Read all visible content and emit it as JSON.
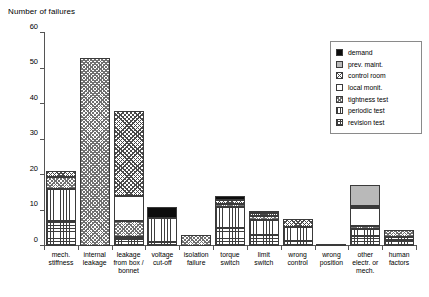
{
  "chart_data": {
    "type": "bar",
    "subtype": "stacked-bar",
    "title": "",
    "ylabel": "Number of failures",
    "xlabel": "",
    "ylim": [
      0,
      60
    ],
    "yticks": [
      0,
      10,
      20,
      30,
      40,
      50,
      60
    ],
    "grid": false,
    "legend_position": "right-top",
    "categories": [
      "mech.\nstiffness",
      "internal\nleakage",
      "leakage\nfrom box /\nbonnet",
      "voltage\ncut-off",
      "isolation\nfailure",
      "torque\nswitch",
      "limit\nswitch",
      "wrong\ncontrol",
      "wrong\nposition",
      "other\nelectr. or\nmech.",
      "human\nfactors"
    ],
    "series": [
      {
        "name": "demand",
        "key": "demand",
        "values": [
          0,
          0,
          0,
          3.0,
          0,
          1.0,
          0.4,
          0,
          0,
          0,
          0
        ]
      },
      {
        "name": "prev. maint.",
        "key": "prev",
        "values": [
          0,
          0,
          0,
          0,
          0,
          0,
          0,
          0,
          0,
          6.0,
          0
        ]
      },
      {
        "name": "control room",
        "key": "control",
        "values": [
          1.5,
          0,
          24.0,
          0,
          0,
          1.2,
          1.0,
          2.4,
          0,
          0.6,
          0
        ]
      },
      {
        "name": "local monit.",
        "key": "local",
        "values": [
          0,
          0,
          7.0,
          0,
          0,
          0,
          0,
          0,
          0,
          5.0,
          0
        ]
      },
      {
        "name": "tightness test",
        "key": "tight",
        "values": [
          3.5,
          53.0,
          4.5,
          0,
          3.0,
          0.8,
          1.2,
          0,
          0,
          0.9,
          2.0
        ]
      },
      {
        "name": "periodic test",
        "key": "period",
        "values": [
          9.0,
          0,
          0.5,
          7.0,
          0,
          6.0,
          4.2,
          3.8,
          0.7,
          2.1,
          1.0
        ]
      },
      {
        "name": "revision test",
        "key": "revision",
        "values": [
          7.0,
          0,
          2.0,
          1.0,
          0,
          5.0,
          3.0,
          1.5,
          0,
          2.7,
          1.6
        ]
      }
    ],
    "totals": [
      21.0,
      53.0,
      38.0,
      11.0,
      3.0,
      14.0,
      9.8,
      7.7,
      0.7,
      16.6,
      4.6
    ]
  },
  "legend": {
    "items": [
      {
        "label": "demand",
        "swatch": "p-demand"
      },
      {
        "label": "prev. maint.",
        "swatch": "p-prev"
      },
      {
        "label": "control room",
        "swatch": "p-control"
      },
      {
        "label": "local monit.",
        "swatch": "p-local"
      },
      {
        "label": "tightness test",
        "swatch": "p-tight"
      },
      {
        "label": "periodic test",
        "swatch": "p-period"
      },
      {
        "label": "revision test",
        "swatch": "p-revision"
      }
    ]
  },
  "colors": {
    "axis": "#555555",
    "outline": "#3a3a3a",
    "demand": "#0d0d0d",
    "prev_maint": "#b9b9b9",
    "background": "#ffffff"
  }
}
